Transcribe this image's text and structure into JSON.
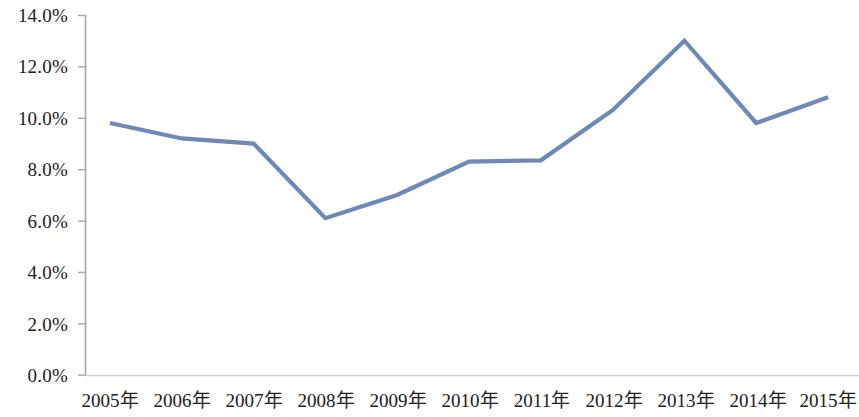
{
  "chart_data": {
    "type": "line",
    "title": "",
    "subtitle": "",
    "xlabel": "",
    "ylabel": "",
    "categories": [
      "2005年",
      "2006年",
      "2007年",
      "2008年",
      "2009年",
      "2010年",
      "2011年",
      "2012年",
      "2013年",
      "2014年",
      "2015年"
    ],
    "series": [
      {
        "name": "",
        "values": [
          9.8,
          9.2,
          9.0,
          6.1,
          7.0,
          8.3,
          8.35,
          10.3,
          13.0,
          9.8,
          10.8
        ]
      }
    ],
    "ylim": [
      0.0,
      14.0
    ],
    "ytick_values": [
      0.0,
      2.0,
      4.0,
      6.0,
      8.0,
      10.0,
      12.0,
      14.0
    ],
    "ytick_labels": [
      "0.0%",
      "2.0%",
      "4.0%",
      "6.0%",
      "8.0%",
      "10.0%",
      "12.0%",
      "14.0%"
    ],
    "grid": false,
    "legend": "none",
    "value_unit": "%",
    "line_color": "#6E88B8",
    "axis_color": "#A6A6A6",
    "marker": "none"
  },
  "axes": {
    "y": {
      "ticks": [
        {
          "label": "14.0%",
          "value": 14.0
        },
        {
          "label": "12.0%",
          "value": 12.0
        },
        {
          "label": "10.0%",
          "value": 10.0
        },
        {
          "label": "8.0%",
          "value": 8.0
        },
        {
          "label": "6.0%",
          "value": 6.0
        },
        {
          "label": "4.0%",
          "value": 4.0
        },
        {
          "label": "2.0%",
          "value": 2.0
        },
        {
          "label": "0.0%",
          "value": 0.0
        }
      ]
    },
    "x": {
      "ticks": [
        {
          "label": "2005年"
        },
        {
          "label": "2006年"
        },
        {
          "label": "2007年"
        },
        {
          "label": "2008年"
        },
        {
          "label": "2009年"
        },
        {
          "label": "2010年"
        },
        {
          "label": "2011年"
        },
        {
          "label": "2012年"
        },
        {
          "label": "2013年"
        },
        {
          "label": "2014年"
        },
        {
          "label": "2015年"
        }
      ]
    }
  }
}
